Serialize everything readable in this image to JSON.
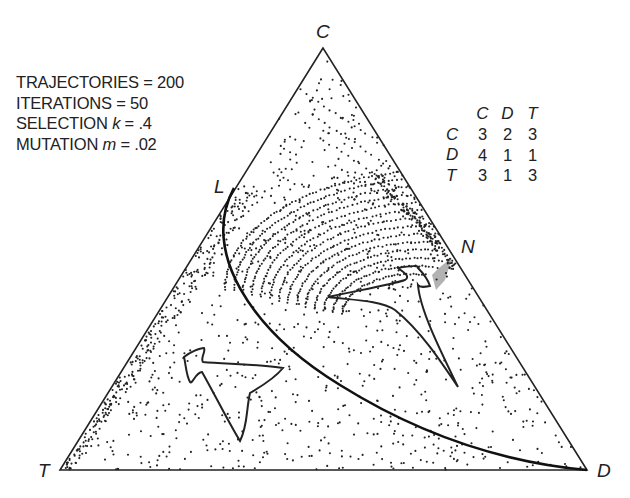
{
  "figure": {
    "title": "",
    "vertices": {
      "top": "C",
      "bottom_left": "T",
      "bottom_right": "D"
    },
    "point_labels": {
      "L": "L",
      "N": "N"
    },
    "parameters": [
      {
        "label": "TRAJECTORIES",
        "var": "",
        "eq": "= 200"
      },
      {
        "label": "ITERATIONS",
        "var": "",
        "eq": "= 50"
      },
      {
        "label": "SELECTION",
        "var": "k",
        "eq": "= .4"
      },
      {
        "label": "MUTATION",
        "var": "m",
        "eq": "= .02"
      }
    ],
    "payoff_matrix": {
      "col_headers": [
        "C",
        "D",
        "T"
      ],
      "rows": [
        {
          "label": "C",
          "values": [
            "3",
            "2",
            "3"
          ]
        },
        {
          "label": "D",
          "values": [
            "4",
            "1",
            "1"
          ]
        },
        {
          "label": "T",
          "values": [
            "3",
            "1",
            "3"
          ]
        }
      ]
    },
    "colors": {
      "ink": "#222222",
      "background": "#ffffff"
    }
  }
}
